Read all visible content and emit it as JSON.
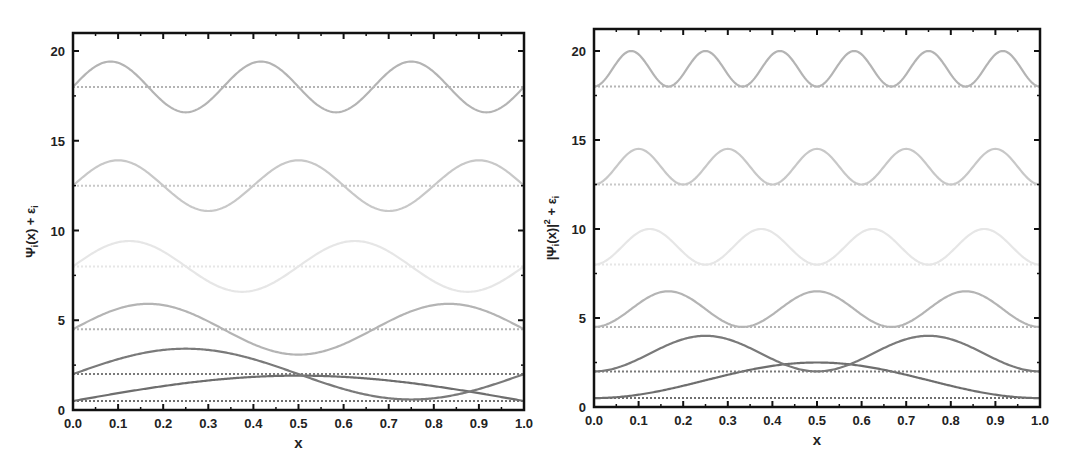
{
  "chart_data": [
    {
      "type": "line",
      "title": "",
      "xlabel": "x",
      "ylabel": "Ψ_i(x) + ε_i",
      "xlim": [
        0.0,
        1.0
      ],
      "ylim": [
        0,
        21
      ],
      "xticks": [
        "0.0",
        "0.1",
        "0.2",
        "0.3",
        "0.4",
        "0.5",
        "0.6",
        "0.7",
        "0.8",
        "0.9",
        "1.0"
      ],
      "yticks": [
        "0",
        "5",
        "10",
        "15",
        "20"
      ],
      "grid": false,
      "legend": null,
      "function": "sqrt(2)*sin(n*pi*x) + eps_n",
      "series": [
        {
          "name": "n=1",
          "n": 1,
          "baseline": 0.5,
          "amplitude": 1.414,
          "color": "#6e6e6e"
        },
        {
          "name": "n=2",
          "n": 2,
          "baseline": 2.0,
          "amplitude": 1.414,
          "color": "#7a7a7a"
        },
        {
          "name": "n=3",
          "n": 3,
          "baseline": 4.5,
          "amplitude": 1.414,
          "color": "#b4b4b4"
        },
        {
          "name": "n=4",
          "n": 4,
          "baseline": 8.0,
          "amplitude": 1.414,
          "color": "#e6e6e6"
        },
        {
          "name": "n=5",
          "n": 5,
          "baseline": 12.5,
          "amplitude": 1.414,
          "color": "#c8c8c8"
        },
        {
          "name": "n=6",
          "n": 6,
          "baseline": 18.0,
          "amplitude": 1.414,
          "color": "#b4b4b4"
        }
      ]
    },
    {
      "type": "line",
      "title": "",
      "xlabel": "x",
      "ylabel": "|Ψ_i(x)|² + ε_i",
      "xlim": [
        0.0,
        1.0
      ],
      "ylim": [
        0,
        21
      ],
      "xticks": [
        "0.0",
        "0.1",
        "0.2",
        "0.3",
        "0.4",
        "0.5",
        "0.6",
        "0.7",
        "0.8",
        "0.9",
        "1.0"
      ],
      "yticks": [
        "0",
        "5",
        "10",
        "15",
        "20"
      ],
      "grid": false,
      "legend": null,
      "function": "2*sin(n*pi*x)^2 + eps_n",
      "series": [
        {
          "name": "n=1",
          "n": 1,
          "baseline": 0.5,
          "amplitude": 2.0,
          "color": "#6e6e6e"
        },
        {
          "name": "n=2",
          "n": 2,
          "baseline": 2.0,
          "amplitude": 2.0,
          "color": "#7a7a7a"
        },
        {
          "name": "n=3",
          "n": 3,
          "baseline": 4.5,
          "amplitude": 2.0,
          "color": "#b4b4b4"
        },
        {
          "name": "n=4",
          "n": 4,
          "baseline": 8.0,
          "amplitude": 2.0,
          "color": "#e6e6e6"
        },
        {
          "name": "n=5",
          "n": 5,
          "baseline": 12.5,
          "amplitude": 2.0,
          "color": "#c8c8c8"
        },
        {
          "name": "n=6",
          "n": 6,
          "baseline": 18.0,
          "amplitude": 2.0,
          "color": "#b4b4b4"
        }
      ]
    }
  ],
  "left": {
    "xlabel": "x",
    "ylabel_main": "Ψ",
    "ylabel_sub": "i",
    "ylabel_rest": "(x) + ε",
    "ylabel_sub2": "i"
  },
  "right": {
    "xlabel": "x",
    "ylabel_main": "|Ψ",
    "ylabel_sub": "i",
    "ylabel_mid": "(x)|",
    "ylabel_sup": "2",
    "ylabel_rest": " + ε",
    "ylabel_sub2": "i"
  },
  "layout": {
    "left_frame": {
      "x0": 73,
      "y0": 33,
      "x1": 524,
      "y1": 410,
      "y_at_0": 410,
      "px_per_unit": 17.95
    },
    "right_frame": {
      "x0": 54,
      "y0": 29,
      "x1": 500,
      "y1": 407,
      "y_at_0": 407,
      "px_per_unit": 17.8
    }
  }
}
